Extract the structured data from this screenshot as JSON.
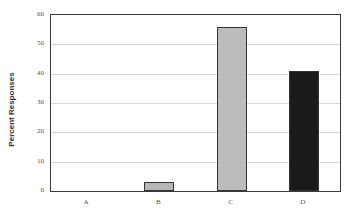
{
  "chart_data": {
    "type": "bar",
    "title": "",
    "xlabel": "",
    "ylabel": "Percent Responses",
    "categories": [
      "A",
      "B",
      "C",
      "D"
    ],
    "values": [
      0,
      3,
      56,
      41
    ],
    "bar_colors": [
      "#c0c0c0",
      "#b8b8b8",
      "#bcbcbc",
      "#1a1a1a"
    ],
    "ylim": [
      0,
      60
    ],
    "yticks": [
      0,
      10,
      20,
      30,
      40,
      50,
      60
    ],
    "grid": true,
    "legend": "none"
  }
}
